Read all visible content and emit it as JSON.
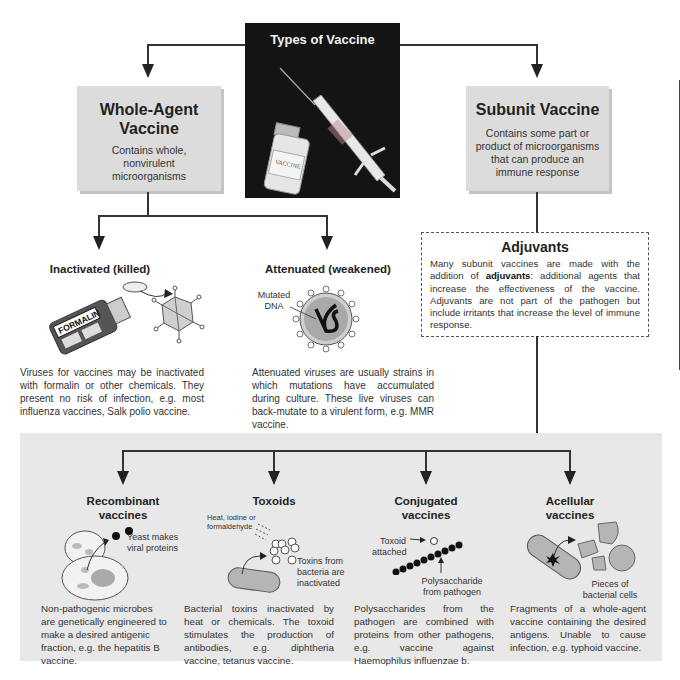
{
  "title_panel": {
    "title": "Types of Vaccine",
    "vial_label": "VACCINE"
  },
  "whole_agent": {
    "title_line1": "Whole-Agent",
    "title_line2": "Vaccine",
    "description": "Contains whole, nonvirulent microorganisms"
  },
  "subunit": {
    "title": "Subunit Vaccine",
    "description": "Contains some part or product of microorganisms that can produce an immune response"
  },
  "inactivated": {
    "heading": "Inactivated (killed)",
    "bottle_label": "FORMALIN",
    "description": "Viruses for vaccines may be inactivated with formalin or other chemicals. They present no risk of infection, e.g. most influenza vaccines, Salk polio vaccine."
  },
  "attenuated": {
    "heading": "Attenuated (weakened)",
    "label_mutated": "Mutated",
    "label_dna": "DNA",
    "description": "Attenuated viruses are usually strains in which mutations have accumulated during culture. These live viruses can back-mutate to a virulent form, e.g. MMR vaccine."
  },
  "adjuvants": {
    "title": "Adjuvants",
    "text_before": "Many subunit vaccines are made with the addition of ",
    "text_bold": "adjuvants",
    "text_after": ": additional agents that increase the effectiveness of the vaccine. Adjuvants are not part of the pathogen but include irritants that increase the level of immune response."
  },
  "subtypes": [
    {
      "heading_line1": "Recombinant",
      "heading_line2": "vaccines",
      "label_line1": "Yeast makes",
      "label_line2": "viral proteins",
      "description": "Non-pathogenic microbes are genetically engineered to make a desired antigenic fraction, e.g. the hepatitis B vaccine."
    },
    {
      "heading_line1": "Toxoids",
      "label_agent_line1": "Heat, iodine or",
      "label_agent_line2": "formaldehyde",
      "label_line1": "Toxins from",
      "label_line2": "bacteria are",
      "label_line3": "inactivated",
      "description": "Bacterial toxins inactivated by heat or chemicals. The toxoid stimulates the production of antibodies, e.g. diphtheria vaccine, tetanus vaccine."
    },
    {
      "heading_line1": "Conjugated",
      "heading_line2": "vaccines",
      "label_toxoid_line1": "Toxoid",
      "label_toxoid_line2": "attached",
      "label_line1": "Polysaccharide",
      "label_line2": "from pathogen",
      "description": "Polysaccharides from the pathogen are combined with proteins from other pathogens, e.g. vaccine against Haemophilus influenzae b."
    },
    {
      "heading_line1": "Acellular",
      "heading_line2": "vaccines",
      "label_line1": "Pieces of",
      "label_line2": "bacterial cells",
      "description": "Fragments of a whole-agent vaccine containing the desired antigens. Unable to cause infection, e.g. typhoid vaccine."
    }
  ],
  "colors": {
    "box_fill": "#dcdcdc",
    "panel_dark": "#141414",
    "bottom_panel": "#e8e8e8",
    "lines": "#333333"
  }
}
